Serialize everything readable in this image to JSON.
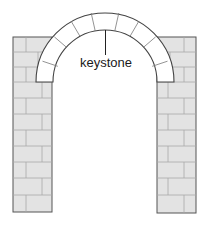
{
  "diagram": {
    "labels": {
      "keystone": "keystone"
    },
    "colors": {
      "wall_fill": "#e3e3e3",
      "wall_stroke": "#555555",
      "mortar": "#a8a8a8",
      "arch_fill": "#ffffff",
      "arch_stroke": "#444444",
      "text": "#1a1a1a"
    },
    "parts": [
      "left-pillar",
      "right-pillar",
      "arch-voussoirs",
      "keystone"
    ]
  }
}
